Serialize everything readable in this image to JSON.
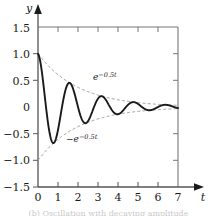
{
  "figure": {
    "axis_labels": {
      "x": "t",
      "y": "y"
    },
    "caption": "(b) Oscillation with decaying amplitude"
  },
  "annotations": {
    "upper": {
      "base": "e",
      "exponent": "−0.5t",
      "full": "e−0.5t"
    },
    "lower": {
      "base": "−e",
      "exponent": "−0.5t",
      "full": "−e−0.5t"
    }
  },
  "colors": {
    "curve": "#1a1a1a",
    "envelope": "#9a9a9a",
    "axis": "#555555",
    "frame": "#777777",
    "background": "#ffffff"
  },
  "chart_data": {
    "type": "line",
    "title": "",
    "xlabel": "t",
    "ylabel": "y",
    "xlim": [
      0,
      7
    ],
    "ylim": [
      -1.5,
      1.5
    ],
    "xticks": [
      0,
      1,
      2,
      3,
      4,
      5,
      6,
      7
    ],
    "xtick_labels": [
      "0",
      "1",
      "2",
      "3",
      "4",
      "5",
      "6",
      "7"
    ],
    "yticks": [
      -1.5,
      -1.0,
      -0.5,
      0,
      0.5,
      1.0,
      1.5
    ],
    "ytick_labels": [
      "−1.5",
      "−1.0",
      "−0.5",
      "0",
      "0.5",
      "1.0",
      "1.5"
    ],
    "grid": false,
    "legend": "none",
    "decay_rate": 0.5,
    "angular_frequency": 3.927,
    "period": 1.6,
    "series": [
      {
        "name": "y = e^{-0.5t} cos(3.927 t)",
        "style": "solid",
        "color": "#1a1a1a",
        "x": [
          0,
          0.2,
          0.4,
          0.6,
          0.8,
          1.0,
          1.2,
          1.4,
          1.6,
          1.8,
          2.0,
          2.2,
          2.4,
          2.6,
          2.8,
          3.0,
          3.2,
          3.4,
          3.6,
          3.8,
          4.0,
          4.2,
          4.4,
          4.6,
          4.8,
          5.0,
          5.2,
          5.4,
          5.6,
          5.8,
          6.0,
          6.2,
          6.4,
          6.6,
          6.8,
          7.0
        ],
        "y": [
          1.0,
          0.629,
          -0.125,
          -0.651,
          -0.67,
          -0.286,
          0.232,
          0.519,
          0.449,
          0.128,
          -0.23,
          -0.375,
          -0.301,
          -0.048,
          0.21,
          0.286,
          0.202,
          0.008,
          -0.176,
          -0.223,
          -0.135,
          0.014,
          0.139,
          0.166,
          0.09,
          -0.025,
          -0.11,
          -0.122,
          -0.06,
          0.027,
          0.085,
          0.09,
          0.04,
          -0.026,
          -0.065,
          -0.066
        ]
      },
      {
        "name": "e^{-0.5t}",
        "style": "dashed",
        "color": "#9a9a9a",
        "x": [
          0,
          0.5,
          1.0,
          1.5,
          2.0,
          2.5,
          3.0,
          3.5,
          4.0,
          4.5,
          5.0,
          5.5,
          6.0,
          6.5,
          7.0
        ],
        "y": [
          1.0,
          0.779,
          0.607,
          0.472,
          0.368,
          0.287,
          0.223,
          0.174,
          0.135,
          0.105,
          0.082,
          0.064,
          0.05,
          0.039,
          0.03
        ]
      },
      {
        "name": "-e^{-0.5t}",
        "style": "dashed",
        "color": "#9a9a9a",
        "x": [
          0,
          0.5,
          1.0,
          1.5,
          2.0,
          2.5,
          3.0,
          3.5,
          4.0,
          4.5,
          5.0,
          5.5,
          6.0,
          6.5,
          7.0
        ],
        "y": [
          -1.0,
          -0.779,
          -0.607,
          -0.472,
          -0.368,
          -0.287,
          -0.223,
          -0.174,
          -0.135,
          -0.105,
          -0.082,
          -0.064,
          -0.05,
          -0.039,
          -0.03
        ]
      }
    ],
    "annotations": [
      {
        "text": "e−0.5t",
        "x": 2.8,
        "y": 0.52
      },
      {
        "text": "−e−0.5t",
        "x": 2.0,
        "y": -0.62
      }
    ]
  }
}
